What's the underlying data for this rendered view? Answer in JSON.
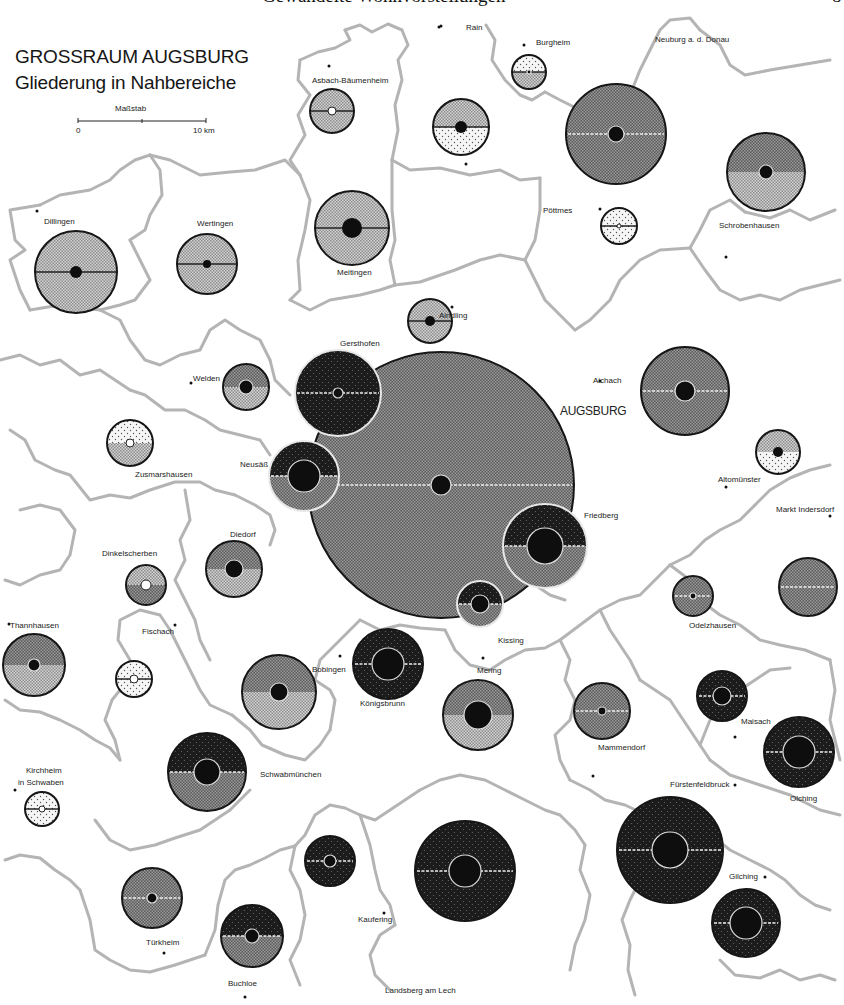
{
  "header": {
    "running_title": "Gewandelte Wohnvorstellungen",
    "page_number": "8"
  },
  "map": {
    "title": "GROSSRAUM AUGSBURG",
    "subtitle": "Gliederung in Nahbereiche",
    "scale": {
      "label": "Maßstab",
      "start": "0",
      "end": "10 km"
    },
    "central_city_label": "AUGSBURG",
    "colors": {
      "background": "#ffffff",
      "border": "#b4b4b4",
      "light_dots": "#efefef",
      "light_gray": "#c8c8c8",
      "medium_gray": "#6e6e6e",
      "dark": "#2a2a2a",
      "core": "#0e0e0e",
      "outline": "#161616"
    },
    "place_labels": [
      {
        "name": "Neuburg a. d. Donau",
        "x": 655,
        "y": 42
      },
      {
        "name": "Rain",
        "x": 466,
        "y": 30
      },
      {
        "name": "Burgheim",
        "x": 536,
        "y": 45
      },
      {
        "name": "Asbach-Bäumenheim",
        "x": 312,
        "y": 83
      },
      {
        "name": "Dillingen",
        "x": 44,
        "y": 224
      },
      {
        "name": "Wertingen",
        "x": 197,
        "y": 226
      },
      {
        "name": "Meitingen",
        "x": 337,
        "y": 275
      },
      {
        "name": "Pöttmes",
        "x": 543,
        "y": 213
      },
      {
        "name": "Schrobenhausen",
        "x": 719,
        "y": 228
      },
      {
        "name": "Aindling",
        "x": 439,
        "y": 318
      },
      {
        "name": "Gersthofen",
        "x": 340,
        "y": 346
      },
      {
        "name": "Welden",
        "x": 193,
        "y": 381
      },
      {
        "name": "Aichach",
        "x": 593,
        "y": 383
      },
      {
        "name": "Zusmarshausen",
        "x": 135,
        "y": 477
      },
      {
        "name": "Neusäß",
        "x": 240,
        "y": 467
      },
      {
        "name": "Altomünster",
        "x": 718,
        "y": 482
      },
      {
        "name": "Friedberg",
        "x": 584,
        "y": 518
      },
      {
        "name": "Markt Indersdorf",
        "x": 776,
        "y": 512
      },
      {
        "name": "Diedorf",
        "x": 230,
        "y": 537
      },
      {
        "name": "Dinkelscherben",
        "x": 102,
        "y": 556
      },
      {
        "name": "Thannhausen",
        "x": 10,
        "y": 628
      },
      {
        "name": "Fischach",
        "x": 142,
        "y": 634
      },
      {
        "name": "Kissing",
        "x": 498,
        "y": 643
      },
      {
        "name": "Odelzhausen",
        "x": 689,
        "y": 628
      },
      {
        "name": "Mering",
        "x": 477,
        "y": 673
      },
      {
        "name": "Bobingen",
        "x": 312,
        "y": 672
      },
      {
        "name": "Königsbrunn",
        "x": 360,
        "y": 706
      },
      {
        "name": "Mammendorf",
        "x": 598,
        "y": 750
      },
      {
        "name": "Maisach",
        "x": 741,
        "y": 724
      },
      {
        "name": "Schwabmünchen",
        "x": 260,
        "y": 777
      },
      {
        "name": "Kirchheim",
        "x": 26,
        "y": 773
      },
      {
        "name": "in Schwaben",
        "x": 18,
        "y": 785
      },
      {
        "name": "Fürstenfeldbruck",
        "x": 670,
        "y": 787
      },
      {
        "name": "Olching",
        "x": 790,
        "y": 801
      },
      {
        "name": "Gilching",
        "x": 729,
        "y": 879
      },
      {
        "name": "Kaufering",
        "x": 358,
        "y": 922
      },
      {
        "name": "Türkheim",
        "x": 146,
        "y": 945
      },
      {
        "name": "Buchloe",
        "x": 228,
        "y": 986
      },
      {
        "name": "Landsberg am Lech",
        "x": 385,
        "y": 993
      }
    ],
    "town_dots": [
      [
        37,
        211
      ],
      [
        439,
        27
      ],
      [
        524,
        45
      ],
      [
        329,
        66
      ],
      [
        466,
        164
      ],
      [
        600,
        209
      ],
      [
        726,
        257
      ],
      [
        452,
        307
      ],
      [
        191,
        383
      ],
      [
        600,
        381
      ],
      [
        726,
        487
      ],
      [
        830,
        516
      ],
      [
        483,
        658
      ],
      [
        340,
        656
      ],
      [
        593,
        776
      ],
      [
        735,
        737
      ],
      [
        735,
        785
      ],
      [
        164,
        953
      ],
      [
        245,
        997
      ],
      [
        384,
        913
      ],
      [
        765,
        877
      ],
      [
        15,
        790
      ],
      [
        9,
        624
      ],
      [
        175,
        625
      ],
      [
        441,
        26
      ]
    ],
    "circles": [
      {
        "name": "Augsburg",
        "cx": 441,
        "cy": 485,
        "r": 133,
        "top": "medium",
        "bottom": "medium",
        "core": 10,
        "line": "white"
      },
      {
        "name": "Gersthofen",
        "cx": 338,
        "cy": 393,
        "r": 43,
        "top": "dark",
        "bottom": "dark",
        "core": 5,
        "core_style": "ring",
        "line": "white",
        "edge": "white"
      },
      {
        "name": "Neusäß",
        "cx": 304,
        "cy": 476,
        "r": 35,
        "top": "dark",
        "bottom": "medium",
        "core": 16,
        "line": "white",
        "edge": "white"
      },
      {
        "name": "Friedberg",
        "cx": 545,
        "cy": 546,
        "r": 42,
        "top": "dark",
        "bottom": "medium",
        "core": 18,
        "line": "white",
        "edge": "white"
      },
      {
        "name": "Kissing",
        "cx": 480,
        "cy": 604,
        "r": 23,
        "top": "dark",
        "bottom": "medium",
        "core": 9,
        "line": "white",
        "edge": "white"
      },
      {
        "name": "Burgheim",
        "cx": 529,
        "cy": 72,
        "r": 17,
        "top": "light_dots",
        "bottom": "light_gray",
        "core": 2,
        "core_style": "ring",
        "line": "dark"
      },
      {
        "name": "Asbach-Bäumenheim",
        "cx": 332,
        "cy": 111,
        "r": 22,
        "top": "light_gray",
        "bottom": "light_gray",
        "core": 4,
        "core_style": "white",
        "line": "dark"
      },
      {
        "name": "Rain",
        "cx": 461,
        "cy": 127,
        "r": 28,
        "top": "light_gray",
        "bottom": "light_dots",
        "core": 6,
        "line": "dark"
      },
      {
        "name": "Neuburg",
        "cx": 616,
        "cy": 134,
        "r": 50,
        "top": "medium",
        "bottom": "medium",
        "core": 8,
        "line": "white"
      },
      {
        "name": "Schrobenhausen",
        "cx": 766,
        "cy": 172,
        "r": 39,
        "top": "medium",
        "bottom": "light_gray",
        "core": 7,
        "line": "none"
      },
      {
        "name": "Dillingen",
        "cx": 76,
        "cy": 272,
        "r": 41,
        "top": "light_gray",
        "bottom": "light_gray",
        "core": 6,
        "line": "dark"
      },
      {
        "name": "Wertingen",
        "cx": 207,
        "cy": 264,
        "r": 30,
        "top": "light_gray",
        "bottom": "light_gray",
        "core": 4,
        "line": "dark"
      },
      {
        "name": "Meitingen",
        "cx": 352,
        "cy": 228,
        "r": 37,
        "top": "light_gray",
        "bottom": "light_gray",
        "core": 10,
        "line": "dark"
      },
      {
        "name": "Pöttmes",
        "cx": 619,
        "cy": 226,
        "r": 18,
        "top": "light_dots",
        "bottom": "light_dots",
        "core": 2,
        "core_style": "white",
        "line": "dark"
      },
      {
        "name": "Aindling",
        "cx": 430,
        "cy": 321,
        "r": 22,
        "top": "light_gray",
        "bottom": "light_gray",
        "core": 5,
        "line": "dark"
      },
      {
        "name": "Welden",
        "cx": 246,
        "cy": 387,
        "r": 23,
        "top": "medium",
        "bottom": "light_gray",
        "core": 7,
        "line": "none"
      },
      {
        "name": "Aichach",
        "cx": 685,
        "cy": 391,
        "r": 44,
        "top": "medium",
        "bottom": "medium",
        "core": 10,
        "line": "white"
      },
      {
        "name": "Altomünster",
        "cx": 778,
        "cy": 452,
        "r": 22,
        "top": "light_gray",
        "bottom": "light_dots",
        "core": 5,
        "line": "none"
      },
      {
        "name": "Zusmarshausen",
        "cx": 130,
        "cy": 443,
        "r": 23,
        "top": "light_dots",
        "bottom": "light_gray",
        "core": 4,
        "core_style": "white",
        "line": "none"
      },
      {
        "name": "Diedorf",
        "cx": 234,
        "cy": 569,
        "r": 28,
        "top": "medium",
        "bottom": "light_gray",
        "core": 9,
        "line": "none"
      },
      {
        "name": "Dinkelscherben",
        "cx": 146,
        "cy": 585,
        "r": 20,
        "top": "light_gray",
        "bottom": "medium",
        "core": 5,
        "core_style": "white",
        "line": "none"
      },
      {
        "name": "Markt Indersdorf",
        "cx": 808,
        "cy": 587,
        "r": 29,
        "top": "medium",
        "bottom": "medium",
        "core": 0,
        "line": "white"
      },
      {
        "name": "Odelzhausen",
        "cx": 693,
        "cy": 596,
        "r": 20,
        "top": "medium",
        "bottom": "medium",
        "core": 3,
        "line": "white"
      },
      {
        "name": "Thannhausen",
        "cx": 34,
        "cy": 665,
        "r": 31,
        "top": "medium",
        "bottom": "light_gray",
        "core": 6,
        "line": "none"
      },
      {
        "name": "Fischach",
        "cx": 134,
        "cy": 679,
        "r": 18,
        "top": "light_dots",
        "bottom": "light_dots",
        "core": 4,
        "core_style": "white",
        "line": "dark"
      },
      {
        "name": "Bobingen",
        "cx": 279,
        "cy": 692,
        "r": 37,
        "top": "medium",
        "bottom": "light_gray",
        "core": 9,
        "line": "none"
      },
      {
        "name": "Königsbrunn",
        "cx": 388,
        "cy": 664,
        "r": 35,
        "top": "dark",
        "bottom": "dark",
        "core": 16,
        "line": "white"
      },
      {
        "name": "Mering",
        "cx": 478,
        "cy": 715,
        "r": 35,
        "top": "medium",
        "bottom": "light_gray",
        "core": 14,
        "line": "none"
      },
      {
        "name": "Mammendorf",
        "cx": 602,
        "cy": 711,
        "r": 28,
        "top": "medium",
        "bottom": "medium",
        "core": 4,
        "line": "white"
      },
      {
        "name": "Maisach",
        "cx": 722,
        "cy": 696,
        "r": 25,
        "top": "dark",
        "bottom": "dark",
        "core": 9,
        "line": "white"
      },
      {
        "name": "Olching",
        "cx": 799,
        "cy": 752,
        "r": 35,
        "top": "dark",
        "bottom": "dark",
        "core": 16,
        "line": "white"
      },
      {
        "name": "Schwabmünchen",
        "cx": 207,
        "cy": 772,
        "r": 39,
        "top": "dark",
        "bottom": "medium",
        "core": 13,
        "line": "white"
      },
      {
        "name": "Kirchheim",
        "cx": 42,
        "cy": 809,
        "r": 17,
        "top": "light_dots",
        "bottom": "light_dots",
        "core": 3,
        "core_style": "white",
        "line": "dark"
      },
      {
        "name": "Fürstenfeldbruck",
        "cx": 670,
        "cy": 850,
        "r": 53,
        "top": "dark",
        "bottom": "dark",
        "core": 18,
        "line": "white"
      },
      {
        "name": "Lech",
        "cx": 465,
        "cy": 871,
        "r": 50,
        "top": "dark",
        "bottom": "dark",
        "core": 16,
        "line": "white"
      },
      {
        "name": "Kaufering-area",
        "cx": 330,
        "cy": 861,
        "r": 25,
        "top": "dark",
        "bottom": "dark",
        "core": 6,
        "line": "white"
      },
      {
        "name": "Türkheim",
        "cx": 152,
        "cy": 898,
        "r": 30,
        "top": "medium",
        "bottom": "medium",
        "core": 5,
        "line": "white"
      },
      {
        "name": "Buchloe",
        "cx": 252,
        "cy": 936,
        "r": 31,
        "top": "dark",
        "bottom": "medium",
        "core": 7,
        "line": "white"
      },
      {
        "name": "Gilching",
        "cx": 746,
        "cy": 923,
        "r": 34,
        "top": "dark",
        "bottom": "dark",
        "core": 16,
        "line": "white"
      }
    ],
    "borders": [
      "M 345 30 L 360 25 L 372 32 L 388 24 L 402 30 L 408 45 L 398 60 L 402 80 L 395 105 L 398 130 L 392 160",
      "M 300 60 L 318 52 L 335 48 L 350 40 L 345 30",
      "M 300 60 L 298 80 L 310 95 L 298 115 L 305 135 L 290 160 L 300 175",
      "M 392 160 L 410 170 L 440 168 L 470 175 L 500 170 L 520 180 L 540 178",
      "M 486 25 L 495 40 L 492 60 L 505 80 L 520 95 L 532 100 L 545 92",
      "M 545 92 L 560 100 L 580 110 L 600 120 L 618 118",
      "M 618 118 L 630 95 L 640 70 L 650 50 L 660 30 L 670 20 L 690 18 L 700 30",
      "M 40 205 L 10 210 L 15 240 L 25 250 L 10 260 L 20 290 L 30 310",
      "M 40 205 L 60 195 L 90 190 L 110 180 L 120 170 L 135 160 L 150 155",
      "M 150 155 L 160 170 L 162 195 L 150 215 L 145 230 L 130 240",
      "M 130 240 L 140 260 L 150 280 L 135 300 L 120 305 L 100 310",
      "M 30 310 L 60 305 L 100 310",
      "M 150 155 L 170 160 L 200 175 L 230 172 L 255 170 L 270 165 L 285 160 L 300 175",
      "M 300 175 L 310 200 L 305 230 L 298 260 L 300 290 L 290 300",
      "M 290 300 L 310 310 L 330 300 L 360 295 L 380 290 L 395 285",
      "M 395 285 L 390 260 L 395 240 L 392 210 L 392 160",
      "M 395 285 L 420 282 L 455 270 L 480 260 L 500 255 L 525 260",
      "M 525 260 L 535 240 L 540 210 L 540 178",
      "M 525 260 L 535 280 L 545 300 L 560 315 L 575 330",
      "M 575 330 L 590 320 L 610 300 L 620 280 L 640 260 L 660 250 L 690 248",
      "M 690 248 L 700 230 L 710 210 L 730 200 L 745 212",
      "M 745 212 L 770 218 L 790 210 L 810 220 L 835 210",
      "M 690 248 L 705 270 L 720 290 L 740 300 L 760 295 L 780 300 L 800 290 L 820 285 L 840 280",
      "M 700 30 L 720 45 L 730 65 L 745 75 L 770 70 L 800 65 L 830 60",
      "M 100 310 L 120 320 L 130 340 L 145 360 L 160 365 L 180 355 L 200 350 L 210 330 L 225 320 L 240 330 L 260 340 L 270 360",
      "M 270 360 L 275 380 L 290 395",
      "M 0 360 L 20 355 L 40 365 L 60 360 L 80 375 L 100 370 L 115 380 L 130 390",
      "M 130 390 L 145 395 L 165 410 L 185 410 L 205 420 L 220 430 L 240 435 L 260 440 L 270 455",
      "M 10 430 L 25 440 L 35 460 L 55 470 L 70 475 L 90 500 L 110 495 L 130 498 L 150 490 L 175 482 L 200 482 L 215 490 L 235 495",
      "M 20 510 L 40 505 L 60 510 L 75 530 L 70 555 L 60 570 L 40 575 L 20 585 L 5 580",
      "M 185 490 L 190 520 L 180 540 L 185 560 L 175 580 L 185 600 L 195 620 L 200 640 L 210 660",
      "M 235 495 L 255 505 L 270 515 L 275 530 L 270 545",
      "M 5 700 L 20 710 L 40 712 L 60 720 L 80 730 L 95 740 L 110 748 L 120 760",
      "M 120 760 L 115 740 L 105 720 L 112 700 L 120 690 L 130 660 L 118 640 L 120 620 L 140 610 L 160 615 L 170 630",
      "M 170 630 L 180 650 L 190 670 L 200 690 L 210 705 L 232 715",
      "M 232 715 L 250 730 L 262 745 L 285 755 L 305 760 L 320 745 L 330 730",
      "M 330 730 L 335 700 L 330 690 L 315 680 L 320 660 L 340 640 L 360 620",
      "M 360 620 L 380 630 L 400 625 L 420 628 L 445 630",
      "M 445 630 L 455 650 L 470 665 L 490 670 L 505 660 L 525 650 L 545 648 L 560 640",
      "M 560 640 L 580 625 L 600 610 L 620 600 L 640 595 L 655 580 L 670 565",
      "M 670 565 L 690 555 L 705 540 L 720 530 L 740 520 L 755 505",
      "M 755 505 L 770 490 L 790 478 L 810 470 L 830 465",
      "M 600 610 L 610 630 L 620 645 L 630 660 L 640 680",
      "M 640 680 L 655 690 L 670 700 L 680 715 L 690 730 L 700 745 L 710 760",
      "M 560 640 L 570 660 L 565 680 L 575 700 L 570 720 L 555 735 L 560 760 L 570 780",
      "M 710 760 L 730 775 L 760 785 L 790 795 L 820 810 L 840 815",
      "M 670 565 L 690 580 L 700 600 L 720 615 L 740 625 L 760 640 L 780 645 L 805 650 L 830 660",
      "M 700 745 L 710 720 L 720 700 L 740 690 L 755 680 L 770 670 L 790 668",
      "M 570 780 L 590 790 L 605 800 L 625 805 L 640 812",
      "M 640 812 L 650 830 L 650 860 L 640 880 L 630 900 L 622 920 L 630 945 L 628 970 L 635 995",
      "M 5 860 L 20 855 L 40 858 L 55 870 L 70 880 L 80 890",
      "M 80 890 L 90 920 L 95 950 L 110 960 L 130 970 L 150 972 L 175 965 L 205 955",
      "M 95 820 L 110 840 L 130 850 L 155 845 L 175 838 L 200 830 L 215 820 L 230 810",
      "M 230 810 L 240 800 L 250 790",
      "M 205 955 L 215 930 L 218 905 L 225 880 L 235 870 L 250 865 L 265 858 L 280 850 L 295 846",
      "M 295 846 L 305 835 L 315 815 L 330 805 L 345 808 L 360 815 L 375 820 L 390 810 L 405 800 L 420 790",
      "M 420 790 L 440 780 L 460 775 L 485 780 L 505 790 L 525 800 L 545 810 L 560 815 L 575 830 L 585 845",
      "M 585 845 L 580 870 L 590 895 L 585 920 L 575 945 L 570 970",
      "M 360 815 L 370 845 L 375 870 L 380 890 L 390 905 L 395 925",
      "M 395 925 L 380 935 L 370 955 L 375 975 L 390 990",
      "M 295 846 L 290 870 L 300 890 L 305 915 L 300 940 L 290 960 L 300 985",
      "M 700 820 L 715 838 L 730 850 L 750 860 L 770 870 L 785 880 L 800 895 L 815 905 L 830 910",
      "M 720 960 L 735 975 L 760 978 L 780 970 L 800 980 L 820 975 L 835 980",
      "M 830 660 L 835 690 L 830 720 L 840 760",
      "M 500 550 L 520 575 L 535 585 L 550 595 L 565 600"
    ]
  }
}
